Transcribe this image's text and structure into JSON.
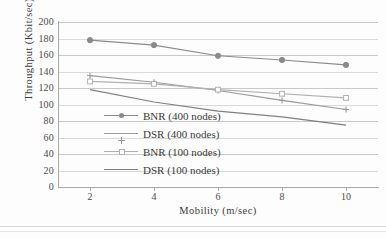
{
  "chart_data": {
    "type": "line",
    "title": "",
    "xlabel": "Mobility (m/sec)",
    "ylabel": "Throughput (Kbit/sec)",
    "x": [
      2,
      4,
      6,
      8,
      10
    ],
    "xtick_labels": [
      "2",
      "4",
      "6",
      "8",
      "10"
    ],
    "ytick_labels": [
      "0",
      "20",
      "40",
      "60",
      "80",
      "100",
      "120",
      "140",
      "160",
      "180",
      "200"
    ],
    "yticks": [
      0,
      20,
      40,
      60,
      80,
      100,
      120,
      140,
      160,
      180,
      200
    ],
    "xlim": [
      1,
      11
    ],
    "ylim": [
      0,
      200
    ],
    "grid": "horizontal",
    "legend_position": "center-left-inside",
    "series": [
      {
        "name": "BNR (400 nodes)",
        "values": [
          178,
          172,
          159,
          154,
          148
        ],
        "color": "#8a8a8a",
        "marker": "circle"
      },
      {
        "name": "DSR (400 nodes)",
        "values": [
          135,
          127,
          117,
          105,
          94
        ],
        "color": "#9a9a9a",
        "marker": "cross"
      },
      {
        "name": "BNR (100 nodes)",
        "values": [
          128,
          125,
          118,
          113,
          108
        ],
        "color": "#b0b0b0",
        "marker": "square"
      },
      {
        "name": "DSR (100 nodes)",
        "values": [
          118,
          103,
          92,
          85,
          75
        ],
        "color": "#7f7f7f",
        "marker": "none"
      }
    ]
  },
  "colors": {
    "grid": "#d9d9d9",
    "axis": "#a8a8a8",
    "text": "#3a3a3a",
    "background": "#fdfdfd"
  }
}
